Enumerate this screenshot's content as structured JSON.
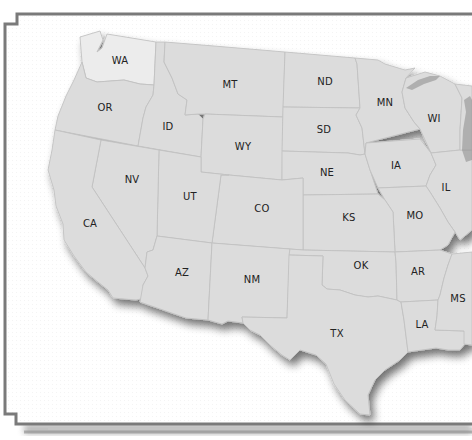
{
  "map": {
    "type": "us-states-outline",
    "region_shown": "Western and Central United States",
    "highlighted_state": "WA",
    "colors": {
      "state_fill": "#dcdcdc",
      "highlight_fill": "#ececec",
      "state_border": "#c2c2c2",
      "frame": "#7a7a7a",
      "background": "#ffffff",
      "label": "#222222"
    },
    "states": [
      {
        "id": "WA",
        "label": "WA",
        "x": 120,
        "y": 60,
        "highlighted": true
      },
      {
        "id": "OR",
        "label": "OR",
        "x": 105,
        "y": 107
      },
      {
        "id": "ID",
        "label": "ID",
        "x": 168,
        "y": 126
      },
      {
        "id": "MT",
        "label": "MT",
        "x": 230,
        "y": 84
      },
      {
        "id": "ND",
        "label": "ND",
        "x": 325,
        "y": 81
      },
      {
        "id": "MN",
        "label": "MN",
        "x": 385,
        "y": 102
      },
      {
        "id": "WI",
        "label": "WI",
        "x": 434,
        "y": 118
      },
      {
        "id": "SD",
        "label": "SD",
        "x": 324,
        "y": 129
      },
      {
        "id": "WY",
        "label": "WY",
        "x": 243,
        "y": 146
      },
      {
        "id": "NV",
        "label": "NV",
        "x": 132,
        "y": 179
      },
      {
        "id": "UT",
        "label": "UT",
        "x": 190,
        "y": 196
      },
      {
        "id": "NE",
        "label": "NE",
        "x": 327,
        "y": 172
      },
      {
        "id": "IA",
        "label": "IA",
        "x": 396,
        "y": 165
      },
      {
        "id": "IL",
        "label": "IL",
        "x": 446,
        "y": 187
      },
      {
        "id": "CA",
        "label": "CA",
        "x": 90,
        "y": 223
      },
      {
        "id": "CO",
        "label": "CO",
        "x": 262,
        "y": 208
      },
      {
        "id": "KS",
        "label": "KS",
        "x": 349,
        "y": 217
      },
      {
        "id": "MO",
        "label": "MO",
        "x": 415,
        "y": 215
      },
      {
        "id": "AZ",
        "label": "AZ",
        "x": 182,
        "y": 272
      },
      {
        "id": "NM",
        "label": "NM",
        "x": 252,
        "y": 279
      },
      {
        "id": "OK",
        "label": "OK",
        "x": 361,
        "y": 265
      },
      {
        "id": "AR",
        "label": "AR",
        "x": 418,
        "y": 271
      },
      {
        "id": "MS",
        "label": "MS",
        "x": 458,
        "y": 298
      },
      {
        "id": "TX",
        "label": "TX",
        "x": 337,
        "y": 333
      },
      {
        "id": "LA",
        "label": "LA",
        "x": 422,
        "y": 324
      }
    ]
  }
}
